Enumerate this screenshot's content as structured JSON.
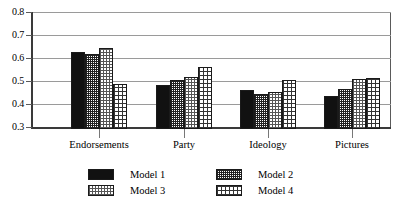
{
  "chart_data": {
    "type": "bar",
    "title": "",
    "xlabel": "",
    "ylabel": "",
    "categories": [
      "Endorsements",
      "Party",
      "Ideology",
      "Pictures"
    ],
    "series": [
      {
        "name": "Model 1",
        "values": [
          0.63,
          0.487,
          0.465,
          0.44
        ],
        "pattern": "solid-black"
      },
      {
        "name": "Model 2",
        "values": [
          0.622,
          0.51,
          0.45,
          0.47
        ],
        "pattern": "fine-grid"
      },
      {
        "name": "Model 3",
        "values": [
          0.648,
          0.522,
          0.46,
          0.512
        ],
        "pattern": "stipple"
      },
      {
        "name": "Model 4",
        "values": [
          0.492,
          0.566,
          0.51,
          0.52
        ],
        "pattern": "checker"
      }
    ],
    "ylim": [
      0.3,
      0.8
    ],
    "yticks": [
      0.3,
      0.4,
      0.5,
      0.6,
      0.7,
      0.8
    ],
    "ytick_labels": [
      "0.3",
      "0.4",
      "0.5",
      "0.6",
      "0.7",
      "0.8"
    ],
    "grid": true,
    "legend_position": "bottom"
  },
  "axis": {
    "y_labels": [
      "0.8",
      "0.7",
      "0.6",
      "0.5",
      "0.4",
      "0.3"
    ]
  },
  "categories": [
    {
      "label": "Endorsements"
    },
    {
      "label": "Party"
    },
    {
      "label": "Ideology"
    },
    {
      "label": "Pictures"
    }
  ],
  "legend": [
    {
      "label": "Model 1"
    },
    {
      "label": "Model 2"
    },
    {
      "label": "Model 3"
    },
    {
      "label": "Model 4"
    }
  ]
}
